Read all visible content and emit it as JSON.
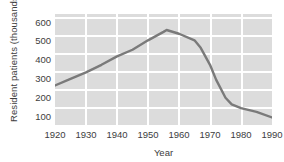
{
  "chart_data": {
    "type": "line",
    "title": "",
    "xlabel": "Year",
    "ylabel": "Resident patients (thousands)",
    "xlim": [
      1920,
      1990
    ],
    "ylim": [
      50,
      640
    ],
    "xticks": [
      1920,
      1930,
      1940,
      1950,
      1960,
      1970,
      1980,
      1990
    ],
    "yticks": [
      100,
      200,
      300,
      400,
      500,
      600
    ],
    "grid": true,
    "legend": "none",
    "plot_background": "#dcdcdc",
    "gridline_color": "#ffffff",
    "line_color": "#7a7a7a",
    "series": [
      {
        "name": "Resident patients",
        "x": [
          1920,
          1925,
          1930,
          1935,
          1940,
          1945,
          1950,
          1955,
          1956,
          1960,
          1965,
          1967,
          1970,
          1972,
          1975,
          1977,
          1980,
          1985,
          1990
        ],
        "values": [
          260,
          295,
          330,
          370,
          415,
          450,
          500,
          545,
          555,
          535,
          500,
          460,
          370,
          290,
          195,
          160,
          140,
          120,
          90
        ]
      }
    ]
  }
}
